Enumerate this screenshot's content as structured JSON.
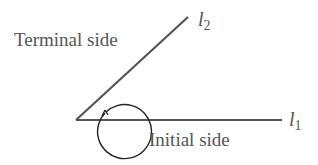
{
  "diagram": {
    "terminal_label": "Terminal side",
    "initial_label": "Initial side",
    "line1": {
      "name": "l",
      "subscript": "1"
    },
    "line2": {
      "name": "l",
      "subscript": "2"
    },
    "colors": {
      "line": "#555555",
      "circle": "#222222",
      "text": "#555555"
    }
  }
}
